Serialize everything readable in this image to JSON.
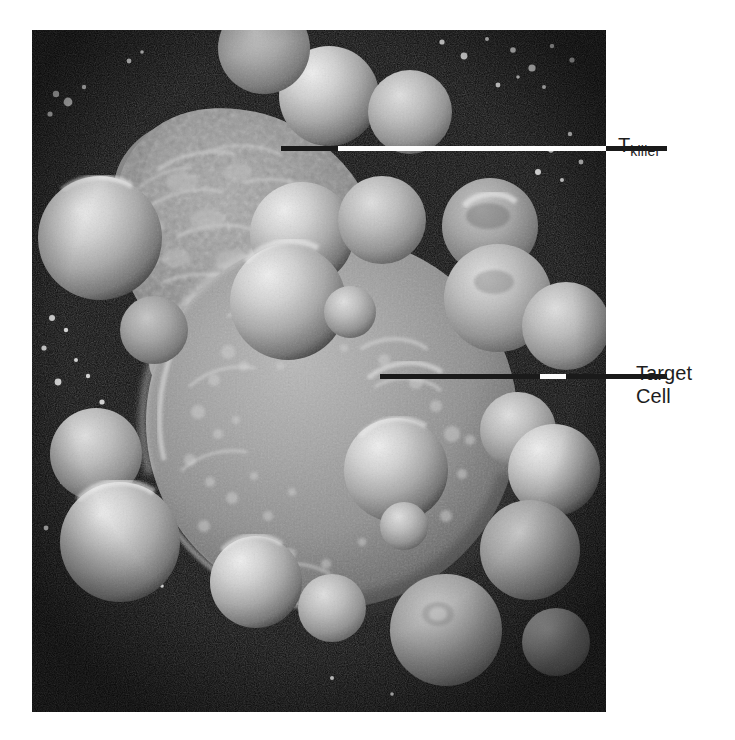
{
  "figure": {
    "type": "scanning-electron-micrograph",
    "background_color": "#ffffff",
    "image_area": {
      "x": 32,
      "y": 30,
      "width": 574,
      "height": 682,
      "background_color": "#0d0d0d"
    }
  },
  "annotations": [
    {
      "id": "t-killer",
      "text_main": "T",
      "text_sub": "killer",
      "text_full": "T killer",
      "label_x": 618,
      "label_y": 134,
      "leader_y": 148,
      "segments": [
        {
          "kind": "black",
          "x": 281,
          "width": 57
        },
        {
          "kind": "white",
          "x": 338,
          "width": 268
        },
        {
          "kind": "black",
          "x": 606,
          "width": 61
        }
      ]
    },
    {
      "id": "target-cell",
      "text_main": "Target",
      "text_line2": "Cell",
      "text_full": "Target Cell",
      "label_x": 636,
      "label_y": 362,
      "leader_y": 376,
      "segments": [
        {
          "kind": "black",
          "x": 380,
          "width": 160
        },
        {
          "kind": "white",
          "x": 540,
          "width": 26
        },
        {
          "kind": "black",
          "x": 566,
          "width": 101
        }
      ]
    }
  ],
  "colors": {
    "leader_black": "#1a1a1a",
    "leader_white": "#fdfdfd",
    "label_text": "#1d1d1d",
    "page_background": "#ffffff",
    "micrograph_dark": "#0d0d0d",
    "cell_midtone": "#8e8e8e",
    "cell_highlight": "#e8e8e8"
  },
  "cells": {
    "target_cell": {
      "name": "Target Cell",
      "cx": 300,
      "cy": 390,
      "r": 185,
      "surface": "smooth-granular"
    },
    "t_killer_cell": {
      "name": "T killer",
      "cx": 178,
      "cy": 155,
      "r": 140,
      "surface": "rough-ruffled"
    },
    "lymphocytes": [
      {
        "cx": 297,
        "cy": 63,
        "r": 48
      },
      {
        "cx": 375,
        "cy": 78,
        "r": 40
      },
      {
        "cx": 70,
        "cy": 207,
        "r": 60
      },
      {
        "cx": 300,
        "cy": 200,
        "r": 48
      },
      {
        "cx": 376,
        "cy": 188,
        "r": 40
      },
      {
        "cx": 466,
        "cy": 195,
        "r": 45
      },
      {
        "cx": 468,
        "cy": 248,
        "r": 50
      },
      {
        "cx": 527,
        "cy": 282,
        "r": 42
      },
      {
        "cx": 235,
        "cy": 235,
        "r": 42
      },
      {
        "cx": 303,
        "cy": 258,
        "r": 25
      },
      {
        "cx": 140,
        "cy": 300,
        "r": 38
      },
      {
        "cx": 78,
        "cy": 400,
        "r": 42
      },
      {
        "cx": 95,
        "cy": 498,
        "r": 55
      },
      {
        "cx": 346,
        "cy": 430,
        "r": 48
      },
      {
        "cx": 360,
        "cy": 480,
        "r": 22
      },
      {
        "cx": 470,
        "cy": 405,
        "r": 35
      },
      {
        "cx": 502,
        "cy": 430,
        "r": 42
      },
      {
        "cx": 500,
        "cy": 510,
        "r": 48
      },
      {
        "cx": 240,
        "cy": 542,
        "r": 42
      },
      {
        "cx": 410,
        "cy": 588,
        "r": 50
      },
      {
        "cx": 534,
        "cy": 625,
        "r": 35
      }
    ]
  }
}
